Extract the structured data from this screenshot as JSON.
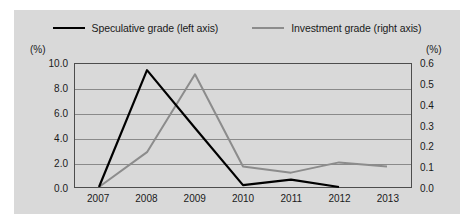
{
  "legend": {
    "entries": [
      {
        "label": "Speculative grade (left axis)",
        "color": "#000000",
        "series": "speculative"
      },
      {
        "label": "Investment grade (right axis)",
        "color": "#8c8c8c",
        "series": "investment"
      }
    ]
  },
  "axes": {
    "left_unit": "(%)",
    "right_unit": "(%)",
    "left_ticks": [
      "10.0",
      "8.0",
      "6.0",
      "4.0",
      "2.0",
      "0.0"
    ],
    "right_ticks": [
      "0.6",
      "0.5",
      "0.4",
      "0.3",
      "0.2",
      "0.1",
      "0.0"
    ],
    "x_ticks": [
      "2007",
      "2008",
      "2009",
      "2010",
      "2011",
      "2012",
      "2013"
    ]
  },
  "colors": {
    "background": "#d9d9d9",
    "page": "#ffffff",
    "frame": "#4d4d4d",
    "gridline": "#8a8a8a",
    "speculative": "#000000",
    "investment": "#8c8c8c"
  },
  "chart_data": {
    "type": "line",
    "title": "",
    "xlabel": "",
    "ylabel": "(%)",
    "grid": true,
    "legend_position": "top",
    "x": [
      "2007",
      "2008",
      "2009",
      "2010",
      "2011",
      "2012",
      "2013"
    ],
    "series": [
      {
        "name": "Speculative grade (left axis)",
        "axis": "left",
        "color": "#000000",
        "values": [
          0.0,
          9.5,
          4.8,
          0.15,
          0.6,
          0.0,
          null
        ],
        "ylim": [
          0,
          10
        ],
        "unit": "%"
      },
      {
        "name": "Investment grade (right axis)",
        "axis": "right",
        "color": "#8c8c8c",
        "values": [
          0.0,
          0.17,
          0.55,
          0.1,
          0.07,
          0.12,
          0.1
        ],
        "ylim": [
          0,
          0.6
        ],
        "unit": "%"
      }
    ]
  }
}
